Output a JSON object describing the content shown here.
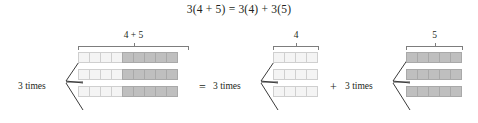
{
  "equation": {
    "text": "3(4 + 5) = 3(4) + 3(5)"
  },
  "colors": {
    "light_cell": "#f4f4f4",
    "dark_cell": "#bfbfbf",
    "cell_border": "#cfcfcf",
    "dark_cell_border": "#a9a9a9",
    "line": "#7d7d7d",
    "text": "#231f20",
    "background": "#ffffff"
  },
  "operators": {
    "equals": "=",
    "plus": "+"
  },
  "groups": [
    {
      "id": "left",
      "brace_label": "4 + 5",
      "times_label": "3 times",
      "rows": 3,
      "cells_per_row": 9,
      "light_cells": 4,
      "dark_cells": 5
    },
    {
      "id": "middle",
      "brace_label": "4",
      "times_label": "3 times",
      "rows": 3,
      "cells_per_row": 4,
      "light_cells": 4,
      "dark_cells": 0
    },
    {
      "id": "right",
      "brace_label": "5",
      "times_label": "3 times",
      "rows": 3,
      "cells_per_row": 5,
      "light_cells": 0,
      "dark_cells": 5
    }
  ]
}
